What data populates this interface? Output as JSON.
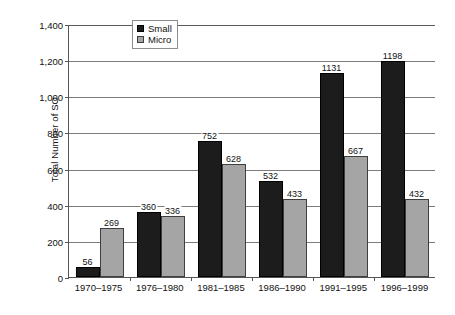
{
  "chart_data": {
    "type": "bar",
    "title": "",
    "xlabel": "",
    "ylabel": "Total Number of SO",
    "ylim": [
      0,
      1400
    ],
    "ytick_values": [
      0,
      200,
      400,
      600,
      800,
      1000,
      1200,
      1400
    ],
    "ytick_labels": [
      "0",
      "200",
      "400",
      "600",
      "800",
      "1,000",
      "1,200",
      "1,400"
    ],
    "grid": "horizontal",
    "legend_position": "top-center",
    "categories": [
      "1970–1975",
      "1976–1980",
      "1981–1985",
      "1986–1990",
      "1991–1995",
      "1996–1999"
    ],
    "series": [
      {
        "name": "Small",
        "color": "#1c1c1c",
        "values": [
          56,
          360,
          752,
          532,
          1131,
          1198
        ],
        "labels": [
          "56",
          "360",
          "752",
          "532",
          "1131",
          "1198"
        ]
      },
      {
        "name": "Micro",
        "color": "#a5a5a5",
        "values": [
          269,
          336,
          628,
          433,
          667,
          432
        ],
        "labels": [
          "269",
          "336",
          "628",
          "433",
          "667",
          "432"
        ]
      }
    ]
  },
  "legend": {
    "items": [
      {
        "label": "Small",
        "swatch": "black-square-swatch"
      },
      {
        "label": "Micro",
        "swatch": "gray-square-swatch"
      }
    ]
  }
}
